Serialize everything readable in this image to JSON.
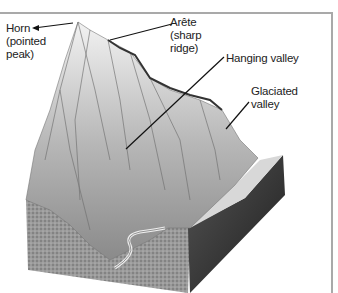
{
  "figure": {
    "labels": {
      "horn": [
        "Horn",
        "(pointed",
        "peak)"
      ],
      "arete": [
        "Arête",
        "(sharp",
        "ridge)"
      ],
      "hanging_valley": [
        "Hanging valley"
      ],
      "glaciated_valley": [
        "Glaciated",
        "valley"
      ]
    }
  },
  "colors": {
    "frame": "#a9a9a9",
    "text": "#222222",
    "leader_line": "#111111"
  }
}
